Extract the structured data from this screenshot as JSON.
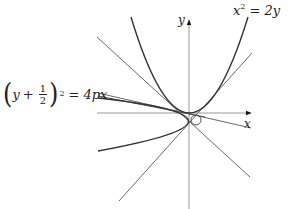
{
  "figure": {
    "type": "geometric-diagram",
    "axes": {
      "x_label": "x",
      "y_label": "y"
    },
    "equations": {
      "upward_parabola": {
        "lhs_var": "x",
        "lhs_exp": "2",
        "rhs": "= 2y"
      },
      "sideways_parabola": {
        "open_paren": "(",
        "var": "y",
        "plus": "+",
        "frac_num": "1",
        "frac_den": "2",
        "close_paren": ")",
        "exp": "2",
        "rhs": "= 4px"
      }
    },
    "colors": {
      "axis": "#9a9a9a",
      "curve": "#333333",
      "tangent": "#6a6a6a",
      "text": "#222222"
    }
  }
}
